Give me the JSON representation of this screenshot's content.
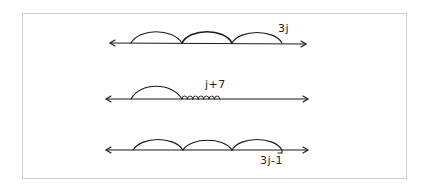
{
  "diagram": {
    "type": "number-line-jumps",
    "lines": [
      {
        "id": "line-1",
        "label": "3j",
        "jumps": "3 equal jumps of size j"
      },
      {
        "id": "line-2",
        "label": "j+7",
        "jumps": "1 jump of size j followed by 7 unit hops"
      },
      {
        "id": "line-3",
        "label": "3j-1",
        "jumps": "3 equal jumps of size j, then step back 1"
      }
    ]
  },
  "labels": {
    "line1": "3j",
    "line2": "j+7",
    "line3": "3j-1"
  }
}
